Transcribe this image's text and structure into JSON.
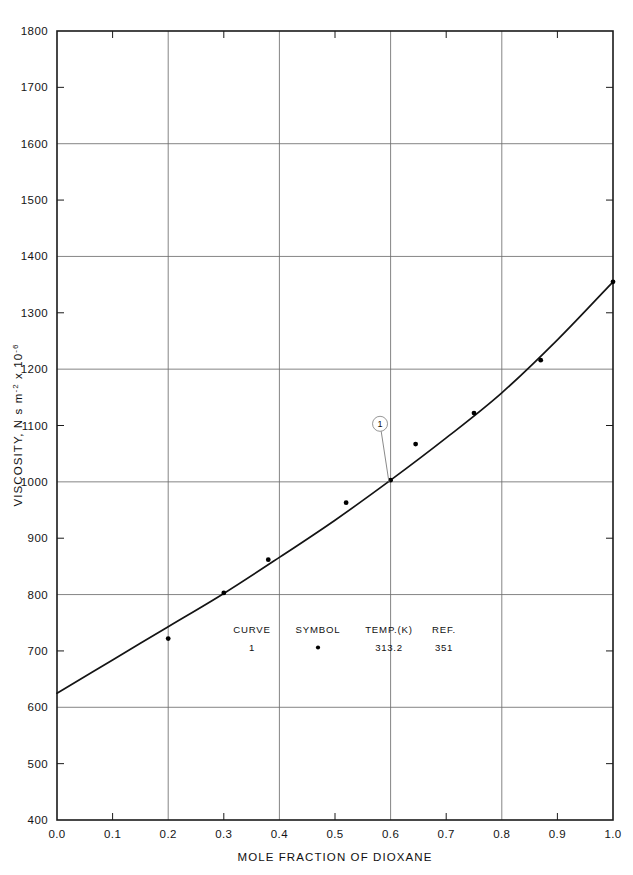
{
  "chart_data": {
    "type": "line",
    "title": "",
    "xlabel": "MOLE FRACTION OF DIOXANE",
    "ylabel": "VISCOSITY, N s m",
    "ylabel_exp1": "-2",
    "ylabel_mid": " x 10",
    "ylabel_exp2": "-6",
    "xlim": [
      0.0,
      1.0
    ],
    "ylim": [
      400,
      1800
    ],
    "grid": true,
    "x_ticks_major": [
      0.0,
      0.2,
      0.4,
      0.6,
      0.8,
      1.0
    ],
    "x_ticks_minor": [
      0.1,
      0.3,
      0.5,
      0.7,
      0.9
    ],
    "x_tick_labels": [
      "0.0",
      "0.1",
      "0.2",
      "0.3",
      "0.4",
      "0.5",
      "0.6",
      "0.7",
      "0.8",
      "0.9",
      "1.0"
    ],
    "x_tick_values": [
      0.0,
      0.1,
      0.2,
      0.3,
      0.4,
      0.5,
      0.6,
      0.7,
      0.8,
      0.9,
      1.0
    ],
    "y_ticks_major": [
      400,
      600,
      800,
      1000,
      1200,
      1400,
      1600,
      1800
    ],
    "y_ticks_minor": [
      500,
      700,
      900,
      1100,
      1300,
      1500,
      1700
    ],
    "y_tick_labels": [
      "400",
      "500",
      "600",
      "700",
      "800",
      "900",
      "1000",
      "1100",
      "1200",
      "1300",
      "1400",
      "1500",
      "1600",
      "1700",
      "1800"
    ],
    "y_tick_values": [
      400,
      500,
      600,
      700,
      800,
      900,
      1000,
      1100,
      1200,
      1300,
      1400,
      1500,
      1600,
      1700,
      1800
    ],
    "series": [
      {
        "name": "1",
        "curve_x": [
          0.0,
          0.1,
          0.2,
          0.3,
          0.4,
          0.5,
          0.6,
          0.7,
          0.8,
          0.9,
          1.0
        ],
        "curve_y": [
          625,
          684,
          743,
          802,
          866,
          932,
          1003,
          1078,
          1158,
          1252,
          1355
        ],
        "points_x": [
          0.2,
          0.3,
          0.38,
          0.52,
          0.6,
          0.645,
          0.75,
          0.87,
          1.0
        ],
        "points_y": [
          722,
          803,
          862,
          963,
          1003,
          1067,
          1122,
          1216,
          1355
        ]
      }
    ],
    "curve_label": {
      "text": "1",
      "x": 0.581,
      "y": 1103,
      "anchor_x": 0.597,
      "anchor_y": 1000
    }
  },
  "legend": {
    "headers": [
      "CURVE",
      "SYMBOL",
      "TEMP.(K)",
      "REF."
    ],
    "rows": [
      {
        "curve": "1",
        "symbol": "•",
        "temp": "313.2",
        "ref": "351"
      }
    ]
  },
  "colors": {
    "axis": "#1a1a1a",
    "grid": "#6e6e6e",
    "curve": "#141414",
    "marker": "#000000",
    "label_line": "#8a8a8a",
    "background": "#ffffff"
  }
}
